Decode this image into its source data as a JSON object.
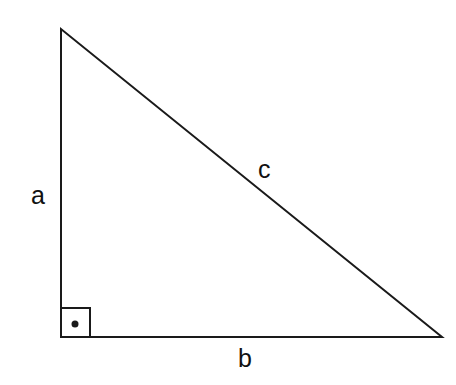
{
  "diagram": {
    "colors": {
      "stroke": "#1a1a1a",
      "background": "#ffffff"
    },
    "vertices": {
      "top": [
        61,
        29
      ],
      "bottom_left": [
        61,
        337
      ],
      "bottom_right": [
        442,
        337
      ]
    },
    "right_angle_marker": {
      "x": 61,
      "y": 308,
      "size": 29,
      "dot": [
        75,
        324
      ]
    },
    "labels": {
      "a": "a",
      "b": "b",
      "c": "c"
    }
  }
}
